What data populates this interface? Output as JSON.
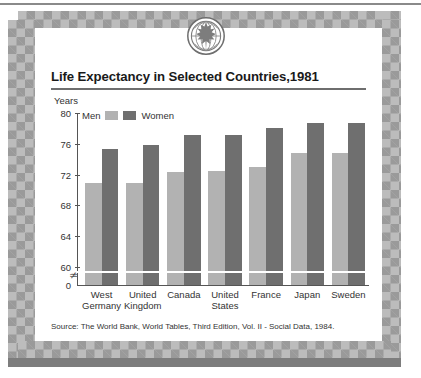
{
  "logo": {
    "name": "globe-maple-leaf-logo"
  },
  "title": "Life Expectancy in Selected Countries,1981",
  "axis": {
    "y_label": "Years",
    "ticks": [
      "80",
      "76",
      "72",
      "68",
      "64",
      "60"
    ],
    "zero_label": "0",
    "break_symbol": "≄"
  },
  "legend": {
    "men_label": "Men",
    "women_label": "Women",
    "men_color": "#b2b2b2",
    "women_color": "#6f6f6f"
  },
  "source": "Source: The World Bank, World Tables, Third Edition, Vol. II - Social Data, 1984.",
  "chart_data": {
    "type": "bar",
    "title": "Life Expectancy in Selected Countries,1981",
    "xlabel": "",
    "ylabel": "Years",
    "ylim": [
      60,
      80
    ],
    "yticks": [
      60,
      64,
      68,
      72,
      76,
      80
    ],
    "axis_break": true,
    "grid": false,
    "legend_position": "top-left",
    "categories": [
      "West\nGermany",
      "United\nKingdom",
      "Canada",
      "United\nStates",
      "France",
      "Japan",
      "Sweden"
    ],
    "series": [
      {
        "name": "Men",
        "color": "#b2b2b2",
        "values": [
          70.9,
          70.9,
          72.4,
          72.5,
          73.0,
          74.8,
          74.8
        ]
      },
      {
        "name": "Women",
        "color": "#6f6f6f",
        "values": [
          75.3,
          75.8,
          77.2,
          77.2,
          78.0,
          78.7,
          78.7
        ]
      }
    ]
  }
}
